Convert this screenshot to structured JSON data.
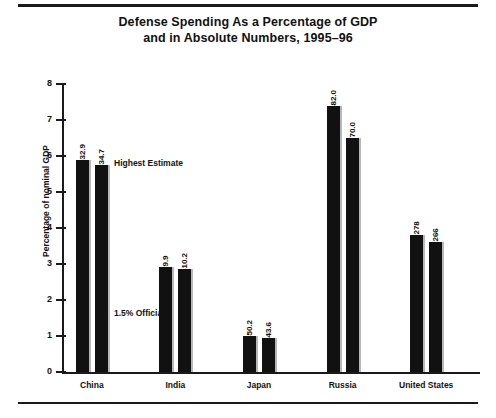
{
  "chart_data": {
    "type": "bar",
    "title_lines": [
      "Defense Spending As a Percentage of GDP",
      "and in Absolute Numbers, 1995–96"
    ],
    "xlabel": "",
    "ylabel": "Percentage of nominal GDP",
    "ylim": [
      0,
      8
    ],
    "yticks": [
      0,
      1,
      2,
      3,
      4,
      5,
      6,
      7,
      8
    ],
    "ytick_labels": [
      "0",
      "1",
      "2",
      "3",
      "4",
      "5",
      "6",
      "7",
      "8"
    ],
    "grid": false,
    "legend": "none",
    "categories": [
      "China",
      "India",
      "Japan",
      "Russia",
      "United States"
    ],
    "series": [
      {
        "name": "Estimate A",
        "values": [
          5.9,
          2.92,
          1.0,
          7.4,
          3.8
        ],
        "data_labels": [
          "$32.9",
          "$9.9",
          "$50.2",
          "$82.0",
          "$278"
        ]
      },
      {
        "name": "Estimate B",
        "values": [
          5.75,
          2.85,
          0.95,
          6.5,
          3.6
        ],
        "data_labels": [
          "$34.7",
          "$10.2",
          "$43.6",
          "$70.0",
          "$266"
        ]
      }
    ],
    "annotations": [
      {
        "text": "Highest Estimate",
        "x_px": 114,
        "y_px": 158
      },
      {
        "text": "1.5% Official",
        "x_px": 114,
        "y_px": 308
      }
    ],
    "colors": {
      "bar": "#111111",
      "bar_shadow": "#b7b7b7",
      "axis": "#1a1a1a",
      "text": "#111111",
      "background": "#ffffff"
    }
  }
}
